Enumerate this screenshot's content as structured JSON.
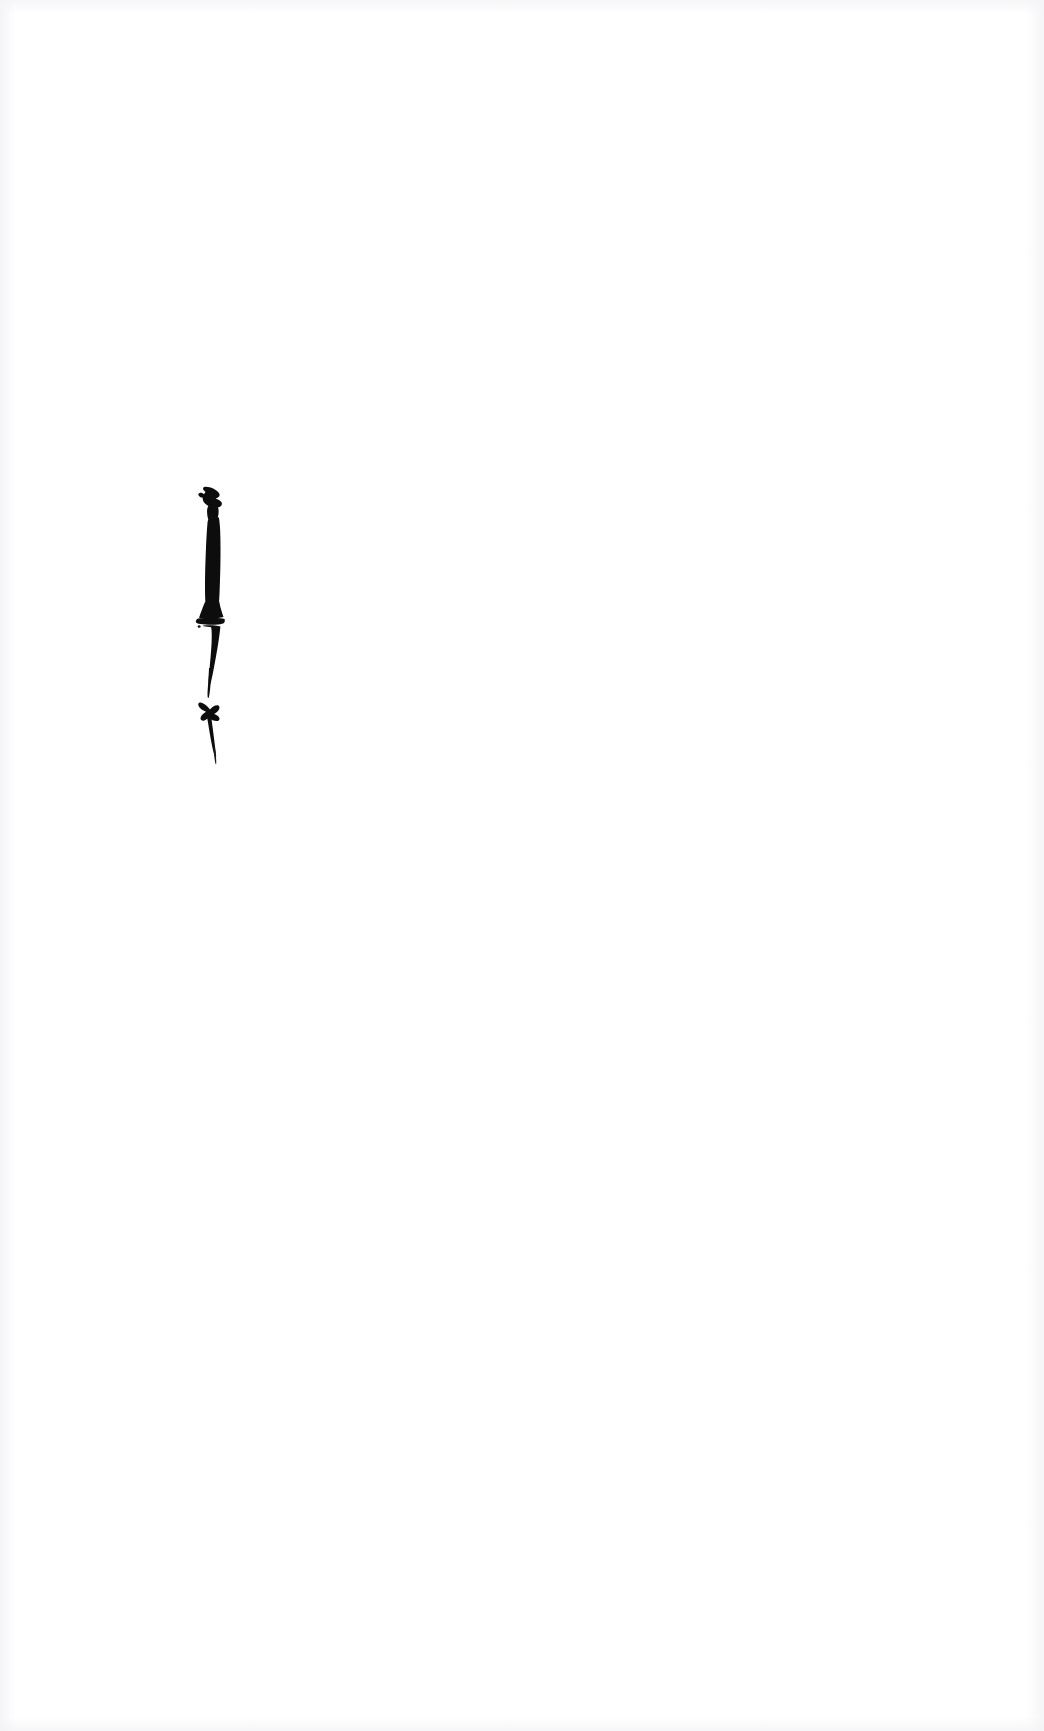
{
  "page": {
    "width": 1044,
    "height": 1731,
    "background_color": "#ffffff",
    "ink_color": "#0d0d0d",
    "text_content": "",
    "visible_text": []
  },
  "marks": [
    {
      "name": "vertical-stroke",
      "label": "",
      "kind": "ink-stroke",
      "color": "#0d0d0d",
      "bbox": {
        "x": 196,
        "y": 487,
        "width": 30,
        "height": 185
      },
      "description": "Thick vertical ink stroke with hooked serif at top, bulging foot, tapering to a fine point"
    },
    {
      "name": "tick-mark",
      "label": "",
      "kind": "ink-stroke",
      "color": "#0d0d0d",
      "bbox": {
        "x": 198,
        "y": 700,
        "width": 26,
        "height": 65
      },
      "description": "Small check / tick shaped ink mark below the vertical stroke"
    }
  ]
}
